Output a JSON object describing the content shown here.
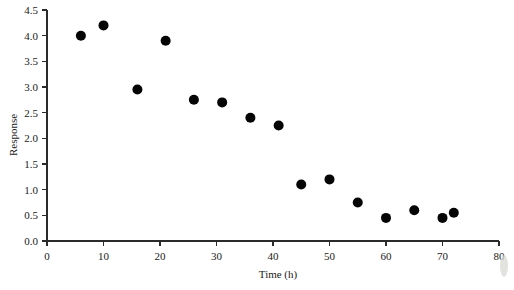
{
  "chart_data": {
    "type": "scatter",
    "title": "",
    "xlabel": "Time (h)",
    "ylabel": "Response",
    "xlim": [
      0,
      80
    ],
    "ylim": [
      0,
      4.5
    ],
    "grid": false,
    "legend": "none",
    "xticks": [
      0,
      10,
      20,
      30,
      40,
      50,
      60,
      70,
      80
    ],
    "xtick_labels": [
      "0",
      "10",
      "20",
      "30",
      "40",
      "50",
      "60",
      "70",
      "80"
    ],
    "yticks": [
      0.0,
      0.5,
      1.0,
      1.5,
      2.0,
      2.5,
      3.0,
      3.5,
      4.0,
      4.5
    ],
    "ytick_labels": [
      "0.0",
      "0.5",
      "1.0",
      "1.5",
      "2.0",
      "2.5",
      "3.0",
      "3.5",
      "4.0",
      "4.5"
    ],
    "series": [
      {
        "name": "Response vs Time",
        "marker": "filled-circle",
        "color": "#050505",
        "marker_size": 9,
        "x": [
          6,
          10,
          16,
          21,
          26,
          31,
          36,
          41,
          45,
          50,
          55,
          60,
          65,
          70,
          72
        ],
        "y": [
          4.0,
          4.2,
          2.95,
          3.9,
          2.75,
          2.7,
          2.4,
          2.25,
          1.1,
          1.2,
          0.75,
          0.45,
          0.6,
          0.45,
          0.55
        ]
      }
    ],
    "points": [
      {
        "x": 6,
        "y": 4.0
      },
      {
        "x": 10,
        "y": 4.2
      },
      {
        "x": 16,
        "y": 2.95
      },
      {
        "x": 21,
        "y": 3.9
      },
      {
        "x": 26,
        "y": 2.75
      },
      {
        "x": 31,
        "y": 2.7
      },
      {
        "x": 36,
        "y": 2.4
      },
      {
        "x": 41,
        "y": 2.25
      },
      {
        "x": 45,
        "y": 1.1
      },
      {
        "x": 50,
        "y": 1.2
      },
      {
        "x": 55,
        "y": 0.75
      },
      {
        "x": 60,
        "y": 0.45
      },
      {
        "x": 65,
        "y": 0.6
      },
      {
        "x": 70,
        "y": 0.45
      },
      {
        "x": 72,
        "y": 0.55
      }
    ]
  },
  "figure": {
    "background_color": "#ffffff",
    "axis_color": "#2b2b2b",
    "marker_color": "#050505"
  }
}
